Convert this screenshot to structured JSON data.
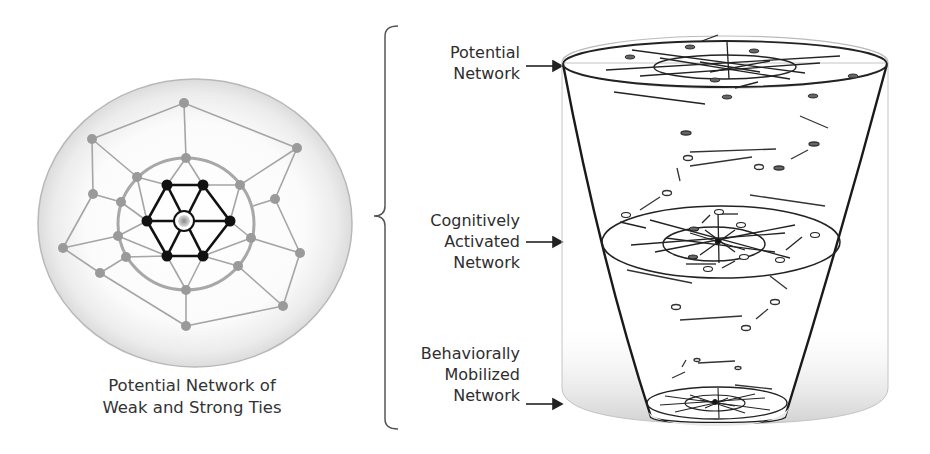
{
  "left_diagram": {
    "caption_line1": "Potential Network of",
    "caption_line2": "Weak and Strong Ties",
    "outer_circle": {
      "cx": 195,
      "cy": 223,
      "rx": 157,
      "ry": 144
    },
    "inner_circle": {
      "cx": 186,
      "cy": 224,
      "rx": 68,
      "ry": 66
    },
    "ego_node": {
      "x": 184,
      "y": 221
    },
    "strong_tie_nodes": [
      [
        167,
        185
      ],
      [
        203,
        185
      ],
      [
        230,
        221
      ],
      [
        203,
        256
      ],
      [
        167,
        256
      ],
      [
        147,
        221
      ]
    ],
    "weak_tie_nodes": [
      [
        184,
        103
      ],
      [
        92,
        139
      ],
      [
        297,
        148
      ],
      [
        186,
        158
      ],
      [
        137,
        177
      ],
      [
        240,
        185
      ],
      [
        93,
        194
      ],
      [
        275,
        199
      ],
      [
        121,
        202
      ],
      [
        118,
        236
      ],
      [
        251,
        238
      ],
      [
        63,
        248
      ],
      [
        300,
        253
      ],
      [
        126,
        257
      ],
      [
        100,
        273
      ],
      [
        238,
        266
      ],
      [
        186,
        290
      ],
      [
        283,
        306
      ],
      [
        186,
        326
      ]
    ],
    "colors": {
      "strong": "#111111",
      "weak": "#9a9a9a",
      "halo": "#d8d8d8"
    }
  },
  "bracket_labels": [
    {
      "id": "potential",
      "lines": [
        "Potential",
        "Network"
      ]
    },
    {
      "id": "cognitive",
      "lines": [
        "Cognitively",
        "Activated",
        "Network"
      ]
    },
    {
      "id": "behavioral",
      "lines": [
        "Behaviorally",
        "Mobilized",
        "Network"
      ]
    }
  ],
  "arrow_glyph": "→",
  "right_diagram": {
    "cylinder": {
      "left": 562,
      "right": 888,
      "top": 63,
      "bottom": 393
    },
    "levels": [
      {
        "name": "potential",
        "cx": 725,
        "cy": 62,
        "rx": 163,
        "ry": 24,
        "inner_rx": 71,
        "inner_ry": 12
      },
      {
        "name": "cognitively-activated",
        "cx": 721,
        "cy": 242,
        "rx": 119,
        "ry": 36,
        "inner_rx": 51,
        "inner_ry": 17
      },
      {
        "name": "behaviorally-mobilized",
        "cx": 717,
        "cy": 403,
        "rx": 70,
        "ry": 16,
        "inner_rx": 30,
        "inner_ry": 8
      }
    ]
  }
}
